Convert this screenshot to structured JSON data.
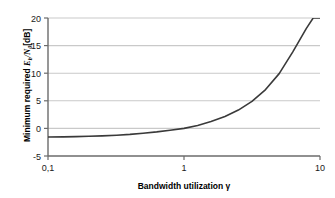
{
  "chart_data": {
    "type": "line",
    "title": "",
    "xlabel": "Bandwidth utilization γ",
    "ylabel": "Minimum required Eb/N0[dB]",
    "ylabel_parts": {
      "prefix": "Minimum required ",
      "symbol_e": "E",
      "symbol_b": "b",
      "slash": "/",
      "symbol_n": "N",
      "symbol_0": "0",
      "units": "[dB]"
    },
    "xscale": "log",
    "yscale": "linear",
    "xlim": [
      0.1,
      10
    ],
    "ylim": [
      -5,
      20
    ],
    "grid": true,
    "grid_axis": "y",
    "legend": "none",
    "xticks": [
      0.1,
      1,
      10
    ],
    "xticklabels": [
      "0,1",
      "1",
      "10"
    ],
    "yticks": [
      -5,
      0,
      5,
      10,
      15,
      20
    ],
    "yticklabels": [
      "-5",
      "0",
      "5",
      "10",
      "15",
      "20"
    ],
    "series": [
      {
        "name": "Shannon bound",
        "formula": "Eb/N0 = (2^gamma - 1) / gamma  [dB]",
        "color": "#3a3a3a",
        "linewidth": 1.6,
        "x": [
          0.1,
          0.13,
          0.16,
          0.2,
          0.25,
          0.32,
          0.4,
          0.5,
          0.63,
          0.79,
          1.0,
          1.26,
          1.58,
          2.0,
          2.51,
          3.16,
          3.98,
          5.01,
          6.31,
          7.94,
          8.91,
          9.44,
          10.0
        ],
        "y": [
          -1.56,
          -1.53,
          -1.49,
          -1.43,
          -1.35,
          -1.23,
          -1.09,
          -0.89,
          -0.63,
          -0.32,
          0.0,
          0.54,
          1.24,
          2.14,
          3.32,
          4.9,
          7.03,
          9.92,
          13.86,
          18.13,
          20.0,
          20.0,
          20.0
        ]
      }
    ],
    "colors": {
      "curve": "#3a3a3a",
      "gridline": "#c9c9c9",
      "axis": "#6b6b6b",
      "text": "#1a1a1a",
      "background": "#ffffff"
    }
  }
}
